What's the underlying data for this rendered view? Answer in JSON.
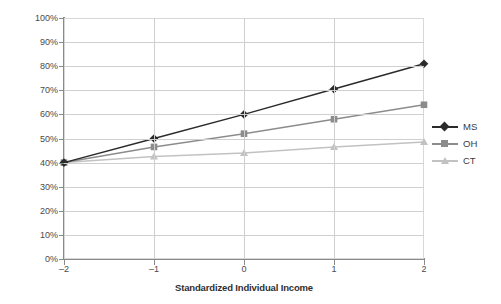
{
  "chart_data": {
    "type": "line",
    "title": "",
    "xlabel": "Standardized Individual Income",
    "ylabel": "Probability of Voting Republican",
    "x": [
      -2,
      -1,
      0,
      1,
      2
    ],
    "x_tick_labels": [
      "–2",
      "–1",
      "0",
      "1",
      "2"
    ],
    "xlim": [
      -2,
      2
    ],
    "ylim": [
      0,
      100
    ],
    "y_tick_labels": [
      "0%",
      "10%",
      "20%",
      "30%",
      "40%",
      "50%",
      "60%",
      "70%",
      "80%",
      "90%",
      "100%"
    ],
    "y_tick_values": [
      0,
      10,
      20,
      30,
      40,
      50,
      60,
      70,
      80,
      90,
      100
    ],
    "grid": true,
    "legend_position": "right",
    "series": [
      {
        "name": "MS",
        "values": [
          40,
          50,
          60,
          70.5,
          81
        ],
        "color": "#2b2b2b",
        "marker": "diamond"
      },
      {
        "name": "OH",
        "values": [
          40,
          46.5,
          52,
          58,
          64
        ],
        "color": "#8c8c8c",
        "marker": "square"
      },
      {
        "name": "CT",
        "values": [
          40,
          42.5,
          44,
          46.5,
          48.5
        ],
        "color": "#c2c2c2",
        "marker": "triangle"
      }
    ]
  },
  "colors": {
    "background": "#ffffff",
    "grid": "#cfcfcf",
    "axis": "#8a8a8a",
    "text": "#3b3b3b"
  }
}
